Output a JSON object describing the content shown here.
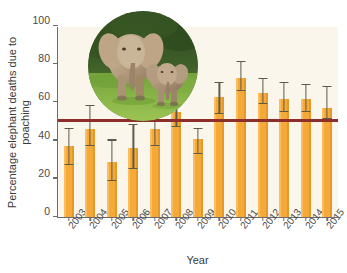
{
  "chart_data": {
    "type": "bar",
    "title": "",
    "xlabel": "Year",
    "ylabel": "Percentage elephant deaths due to poaching",
    "ylim": [
      0,
      100
    ],
    "yticks": [
      0,
      20,
      40,
      60,
      80,
      100
    ],
    "ytick_labels": [
      "0",
      "20",
      "40",
      "60",
      "80",
      "100"
    ],
    "grid": false,
    "legend": "none",
    "categories": [
      "2003",
      "2004",
      "2005",
      "2006",
      "2007",
      "2008",
      "2009",
      "2010",
      "2011",
      "2012",
      "2013",
      "2014",
      "2015"
    ],
    "values": [
      37,
      46,
      29,
      36,
      46,
      55,
      41,
      63,
      73,
      65,
      62,
      62,
      57
    ],
    "error_low": [
      27,
      37,
      19,
      25,
      37,
      47,
      33,
      54,
      66,
      59,
      55,
      55,
      51
    ],
    "error_high": [
      46,
      58,
      40,
      48,
      59,
      60,
      46,
      70,
      81,
      72,
      70,
      69,
      68
    ],
    "reference_line": {
      "value": 50,
      "color": "#8c2f2a",
      "label": ""
    },
    "bar_color": "#f5a938",
    "error_bar_color": "#5f5b46",
    "plot_background": "#faf6ec"
  },
  "inset": {
    "name": "elephant-photo",
    "description": "Adult elephant with calf on grass",
    "shape": "circle"
  },
  "colors": {
    "bar": "#f5a938",
    "reference_line": "#8c2f2a",
    "error_bar": "#5f5b46",
    "axis": "#6b6b6b",
    "plot_bg": "#faf6ec",
    "page_bg": "#ffffff",
    "text": "#3a3a3a"
  }
}
